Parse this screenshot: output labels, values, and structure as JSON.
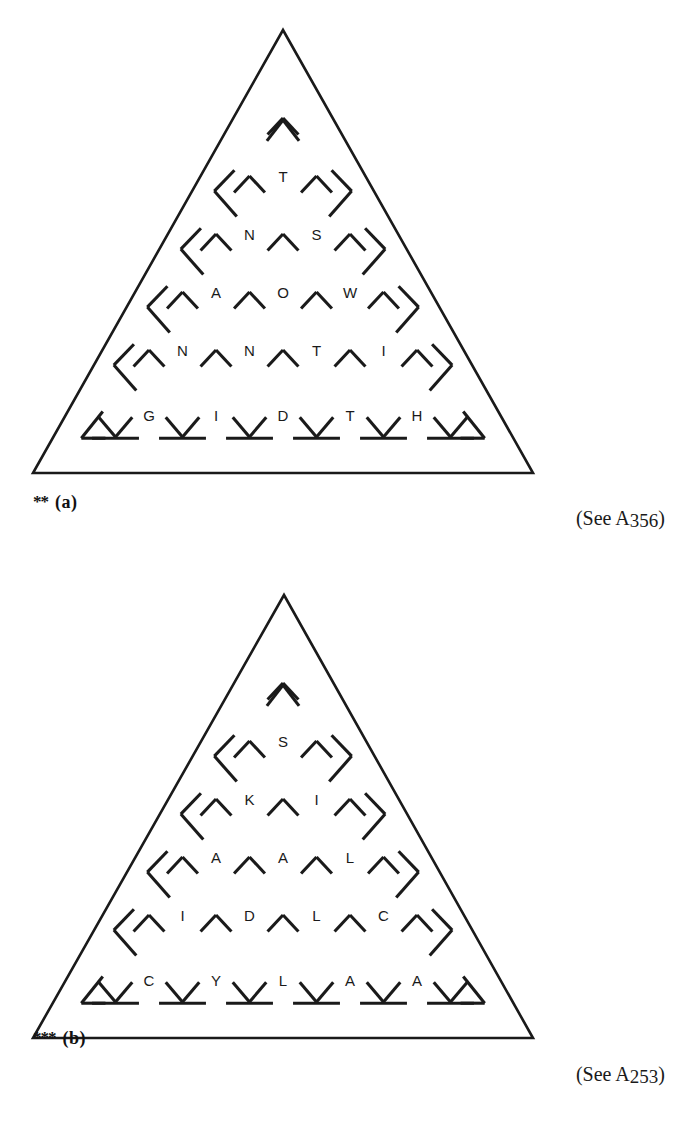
{
  "page": {
    "width": 673,
    "height": 1130,
    "background": "#ffffff",
    "ink": "#1a1a1a"
  },
  "figures": [
    {
      "id": "a",
      "label": "(a)",
      "stars": "**",
      "difficulty": 2,
      "reference": "(See A356)",
      "reference_prefix": "(See A",
      "reference_number": "356",
      "reference_suffix": ")",
      "outline": {
        "apex": [
          283,
          30
        ],
        "bottom_left": [
          33,
          473
        ],
        "bottom_right": [
          533,
          473
        ],
        "stroke_width": 2.6
      },
      "grid": {
        "rows": 6,
        "apex_glyph": "∧",
        "row_baseline_y": [
          130,
          177,
          240,
          300,
          360,
          412
        ],
        "row_spacing": 58.5
      },
      "letter_rows": [
        [],
        [
          "T"
        ],
        [
          "N",
          "S"
        ],
        [
          "A",
          "O",
          "W"
        ],
        [
          "N",
          "N",
          "T",
          "I"
        ],
        [
          "G",
          "I",
          "D",
          "T",
          "H"
        ]
      ]
    },
    {
      "id": "b",
      "label": "(b)",
      "stars": "***",
      "difficulty": 3,
      "reference": "(See A253)",
      "reference_prefix": "(See A",
      "reference_number": "253",
      "reference_suffix": ")",
      "outline": {
        "apex": [
          284,
          30
        ],
        "bottom_left": [
          33,
          473
        ],
        "bottom_right": [
          533,
          473
        ],
        "stroke_width": 2.6
      },
      "grid": {
        "rows": 6,
        "apex_glyph": "∧",
        "row_baseline_y": [
          130,
          177,
          240,
          300,
          360,
          412
        ],
        "row_spacing": 58.5
      },
      "letter_rows": [
        [],
        [
          "S"
        ],
        [
          "K",
          "I"
        ],
        [
          "A",
          "A",
          "L"
        ],
        [
          "I",
          "D",
          "L",
          "C"
        ],
        [
          "C",
          "Y",
          "L",
          "A",
          "A"
        ]
      ]
    }
  ]
}
